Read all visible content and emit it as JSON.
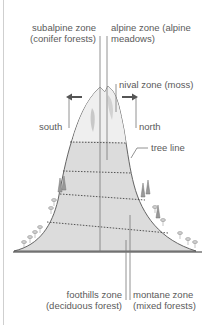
{
  "diagram": {
    "labels": {
      "subalpine_line1": "subalpine zone",
      "subalpine_line2": "(conifer forests)",
      "alpine_line1": "alpine zone (alpine",
      "alpine_line2": "meadows)",
      "nival": "nival zone (moss)",
      "south": "south",
      "north": "north",
      "tree_line": "tree line",
      "foothills_line1": "foothills zone",
      "foothills_line2": "(deciduous forest)",
      "montane_line1": "montane zone",
      "montane_line2": "(mixed forests)"
    },
    "colors": {
      "mountain_fill": "#dcdcdc",
      "upper_fill": "#ececec",
      "outline": "#555555",
      "text": "#5a5a5a",
      "leader": "#777777"
    },
    "zones": [
      "foothills zone",
      "montane zone",
      "subalpine zone",
      "alpine zone",
      "nival zone"
    ]
  }
}
